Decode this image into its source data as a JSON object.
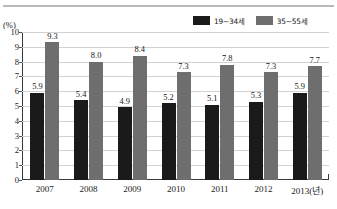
{
  "chart_data": {
    "type": "bar",
    "title": "",
    "subtitle": "",
    "xlabel": "",
    "ylabel": "(%)",
    "unit_label": "(%)",
    "categories": [
      "2007",
      "2008",
      "2009",
      "2010",
      "2011",
      "2012",
      "2013(년)"
    ],
    "series": [
      {
        "name": "19~34세",
        "color": "#1a1a1a",
        "values": [
          5.9,
          5.4,
          4.9,
          5.2,
          5.1,
          5.3,
          5.9
        ],
        "labels": [
          "5.9",
          "5.4",
          "4.9",
          "5.2",
          "5.1",
          "5.3",
          "5.9"
        ]
      },
      {
        "name": "35~55세",
        "color": "#6e6e6e",
        "values": [
          9.3,
          8.0,
          8.4,
          7.3,
          7.8,
          7.3,
          7.7
        ],
        "labels": [
          "9.3",
          "8.0",
          "8.4",
          "7.3",
          "7.8",
          "7.3",
          "7.7"
        ]
      }
    ],
    "ylim": [
      0,
      10
    ],
    "yticks": [
      0,
      1,
      2,
      3,
      4,
      5,
      6,
      7,
      8,
      9,
      10
    ],
    "ytick_labels": [
      "0",
      "1",
      "2",
      "3",
      "4",
      "5",
      "6",
      "7",
      "8",
      "9",
      "10"
    ],
    "grid": true,
    "grid_color": "#d2d2d2",
    "legend_position": "top-right",
    "data_labels": true
  },
  "legend": {
    "entries": [
      {
        "label": "19~34세",
        "color": "#1a1a1a"
      },
      {
        "label": "35~55세",
        "color": "#6e6e6e"
      }
    ]
  }
}
